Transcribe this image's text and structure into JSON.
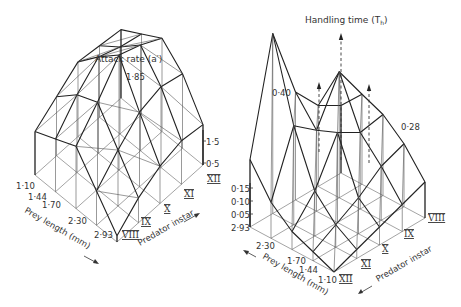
{
  "chart_data": [
    {
      "type": "surface3d",
      "title": "Attack rate (a′)",
      "zlabel": "Attack rate (a′)",
      "xlabel": "Prey length (mm)",
      "ylabel": "Predator instar",
      "x_ticks": [
        "1·10",
        "1·44",
        "1·70",
        "2·30",
        "2·93"
      ],
      "y_ticks": [
        "VIII",
        "IX",
        "X",
        "XI",
        "XII"
      ],
      "z_ticks": [
        "0·5",
        "1·5"
      ],
      "z_max_label": "1·85",
      "zlim": [
        0,
        1.85
      ],
      "grid_note": "rows = prey length (1·10 → 2·93), cols = predator instar (VIII → XII)",
      "values": [
        [
          0.7,
          0.95,
          1.2,
          1.15,
          1.1
        ],
        [
          0.85,
          1.25,
          1.55,
          1.4,
          1.3
        ],
        [
          1.0,
          1.4,
          1.85,
          1.7,
          1.5
        ],
        [
          0.55,
          0.9,
          1.2,
          1.3,
          1.2
        ],
        [
          0.1,
          0.4,
          0.6,
          0.7,
          0.65
        ]
      ]
    },
    {
      "type": "surface3d",
      "title": "Handling time (Th)",
      "zlabel": "Handling time (Th)",
      "xlabel": "Prey length (mm)",
      "ylabel": "Predator instar",
      "x_ticks": [
        "1·10",
        "1·44",
        "1·70",
        "2·30",
        "2·93"
      ],
      "y_ticks": [
        "VIII",
        "IX",
        "X",
        "XI",
        "XII"
      ],
      "z_ticks": [
        "0·05",
        "0·10",
        "0·15"
      ],
      "z_base_label": "2·93",
      "peak_labels": [
        "0·40",
        "0·28"
      ],
      "off_scale_note": "dashed arrows indicate values exceeding the plotted scale",
      "zlim": [
        0,
        0.4
      ],
      "grid_note": "rows = prey length (1·10 → 2·93), cols = predator instar (XII → VIII)",
      "values": [
        [
          0.0,
          0.02,
          0.04,
          0.06,
          0.08
        ],
        [
          0.02,
          0.05,
          0.08,
          0.12,
          0.14
        ],
        [
          0.04,
          0.1,
          0.2,
          0.17,
          0.18
        ],
        [
          0.08,
          0.22,
          0.18,
          0.28,
          0.2
        ],
        [
          0.15,
          0.4,
          0.24,
          0.18,
          0.15
        ]
      ],
      "off_scale_points": [
        {
          "prey": "2·30",
          "instar": "X"
        },
        {
          "prey": "1·70",
          "instar": "X"
        },
        {
          "prey": "1·70",
          "instar": "IX"
        }
      ]
    }
  ],
  "labels": {
    "left_title": "Attack rate (a′)",
    "left_peak": "1·85",
    "left_z1": "1·5",
    "left_z2": "0·5",
    "left_prey_axis": "Prey length (mm)",
    "left_instar_axis": "Predator instar",
    "right_title": "Handling time (T",
    "right_title_sub": "h",
    "right_title_end": ")",
    "right_peak1": "0·40",
    "right_peak2": "0·28",
    "right_z": [
      "0·15",
      "0·10",
      "0·05",
      "2·93"
    ],
    "right_prey_axis": "Prey length (mm)",
    "right_instar_axis": "Predator instar"
  }
}
